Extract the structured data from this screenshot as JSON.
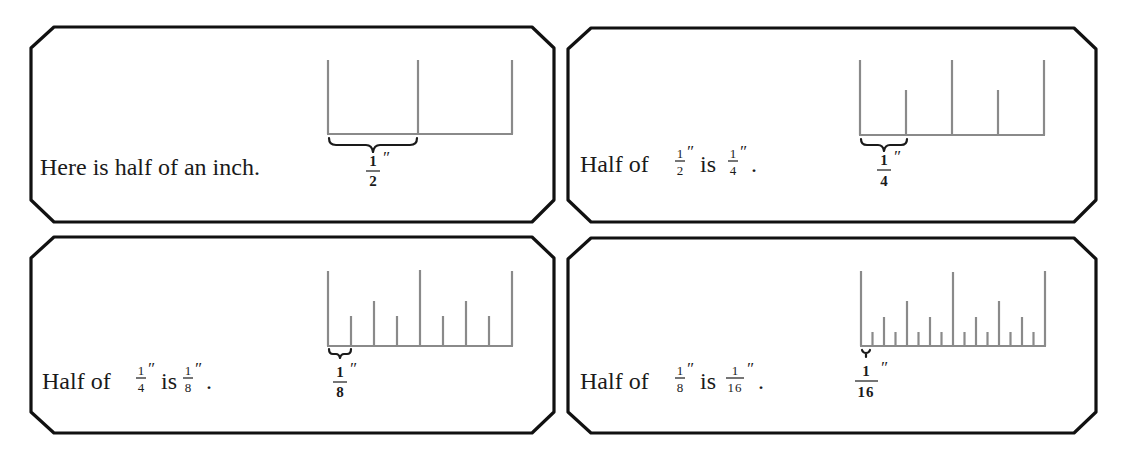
{
  "panels": [
    {
      "id": "half",
      "sentence_plain": "Here is half of an inch.",
      "sentence_parts": [
        "Here is half of an inch."
      ],
      "label": {
        "num": "1",
        "den": "2",
        "unit": "″"
      },
      "ruler": {
        "divisions": 2,
        "highlighted_segment": "1/2 inch"
      }
    },
    {
      "id": "quarter",
      "sentence_plain": "Half of 1/2″ is 1/4″.",
      "sentence_parts": [
        "Half of",
        "1",
        "2",
        "″",
        "is",
        "1",
        "4",
        "″",
        "."
      ],
      "label": {
        "num": "1",
        "den": "4",
        "unit": "″"
      },
      "ruler": {
        "divisions": 4,
        "highlighted_segment": "1/4 inch"
      }
    },
    {
      "id": "eighth",
      "sentence_plain": "Half of 1/4″ is 1/8″.",
      "sentence_parts": [
        "Half of",
        "1",
        "4",
        "″",
        "is",
        "1",
        "8",
        "″",
        "."
      ],
      "label": {
        "num": "1",
        "den": "8",
        "unit": "″"
      },
      "ruler": {
        "divisions": 8,
        "highlighted_segment": "1/8 inch"
      }
    },
    {
      "id": "sixteenth",
      "sentence_plain": "Half of 1/8″ is 1/16″.",
      "sentence_parts": [
        "Half of",
        "1",
        "8",
        "″",
        "is",
        "1",
        "16",
        "″",
        "."
      ],
      "label": {
        "num": "1",
        "den": "16",
        "unit": "″"
      },
      "ruler": {
        "divisions": 16,
        "highlighted_segment": "1/16 inch"
      }
    }
  ],
  "colors": {
    "frame": "#111111",
    "ruler": "#8a8a8a",
    "text": "#1a1a1a"
  }
}
